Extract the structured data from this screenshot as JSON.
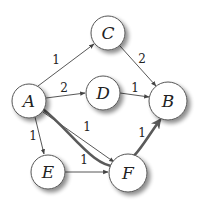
{
  "diagram": {
    "type": "directed-weighted-graph",
    "colors": {
      "edge": "#444444",
      "highlight_path": "#5a5a5a",
      "node_fill": "#ffffff",
      "node_stroke": "#555555",
      "shadow": "#999999"
    },
    "nodes": [
      {
        "id": "A",
        "label": "A",
        "x": 29,
        "y": 101,
        "r": 17
      },
      {
        "id": "B",
        "label": "B",
        "x": 168,
        "y": 101,
        "r": 19
      },
      {
        "id": "C",
        "label": "C",
        "x": 108,
        "y": 33,
        "r": 17
      },
      {
        "id": "D",
        "label": "D",
        "x": 103,
        "y": 93,
        "r": 17
      },
      {
        "id": "E",
        "label": "E",
        "x": 48,
        "y": 172,
        "r": 17
      },
      {
        "id": "F",
        "label": "F",
        "x": 128,
        "y": 173,
        "r": 19
      }
    ],
    "edges": [
      {
        "from": "A",
        "to": "C",
        "weight": "1",
        "label_x": 56,
        "label_y": 64
      },
      {
        "from": "C",
        "to": "B",
        "weight": "2",
        "label_x": 142,
        "label_y": 63
      },
      {
        "from": "A",
        "to": "D",
        "weight": "2",
        "label_x": 64,
        "label_y": 92
      },
      {
        "from": "D",
        "to": "B",
        "weight": "1",
        "label_x": 135,
        "label_y": 92
      },
      {
        "from": "A",
        "to": "F",
        "weight": "1",
        "label_x": 87,
        "label_y": 131
      },
      {
        "from": "A",
        "to": "E",
        "weight": "1",
        "label_x": 33,
        "label_y": 140
      },
      {
        "from": "E",
        "to": "F",
        "weight": "1",
        "label_x": 84,
        "label_y": 164
      },
      {
        "from": "F",
        "to": "B",
        "weight": "1",
        "label_x": 142,
        "label_y": 137
      }
    ],
    "highlighted_path": {
      "nodes": [
        "A",
        "F",
        "B"
      ],
      "description": "thick curved path from A through F to B"
    }
  }
}
